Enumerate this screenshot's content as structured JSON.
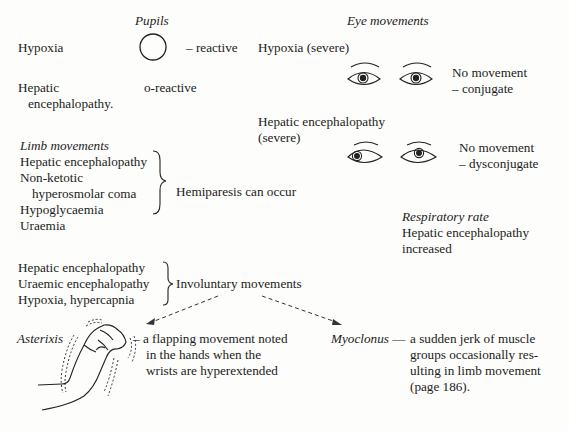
{
  "pupils": {
    "heading": "Pupils",
    "rows": [
      {
        "condition": "Hypoxia",
        "size": "large",
        "label": "– reactive"
      },
      {
        "condition_line1": "Hepatic",
        "condition_line2": "encephalopathy.",
        "size": "small",
        "label": "o-reactive"
      }
    ]
  },
  "eye_movements": {
    "heading": "Eye movements",
    "rows": [
      {
        "condition": "Hypoxia (severe)",
        "label_line1": "No movement",
        "label_line2": "– conjugate"
      },
      {
        "condition_line1": "Hepatic encephalopathy",
        "condition_line2": "(severe)",
        "label_line1": "No movement",
        "label_line2": "– dysconjugate"
      }
    ]
  },
  "limb_movements": {
    "heading": "Limb movements",
    "conditions": [
      "Hepatic encephalopathy",
      "Non-ketotic",
      "hyperosmolar coma",
      "Hypoglycaemia",
      "Uraemia"
    ],
    "outcome": "Hemiparesis can occur"
  },
  "respiratory_rate": {
    "heading": "Respiratory rate",
    "line1": "Hepatic encephalopathy",
    "line2": "increased"
  },
  "involuntary": {
    "conditions": [
      "Hepatic encephalopathy",
      "Uraemic encephalopathy",
      "Hypoxia, hypercapnia"
    ],
    "outcome": "Involuntary movements"
  },
  "asterixis": {
    "term": "Asterixis",
    "desc": [
      "– a flapping movement noted",
      "in the hands when the",
      "wrists are hyperextended"
    ]
  },
  "myoclonus": {
    "term": "Myoclonus",
    "dash": "—",
    "desc": [
      "a sudden jerk of muscle",
      "groups occasionally res-",
      "ulting in limb movement",
      "(page 186)."
    ]
  }
}
